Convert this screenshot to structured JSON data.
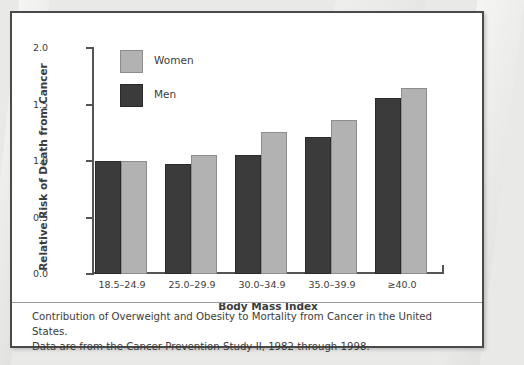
{
  "figure": {
    "caption_line1": "Contribution of Overweight and Obesity to Mortality from Cancer in the United States.",
    "caption_line2": "Data are from the Cancer Prevention Study II, 1982 through 1998."
  },
  "chart_data": {
    "type": "bar",
    "title": "",
    "xlabel": "Body Mass Index",
    "ylabel": "Relative Risk of Death from Cancer",
    "categories": [
      "18.5–24.9",
      "25.0–29.9",
      "30.0–34.9",
      "35.0–39.9",
      "≥40.0"
    ],
    "series": [
      {
        "name": "Men",
        "color": "#3b3b3b",
        "values": [
          1.0,
          0.97,
          1.05,
          1.21,
          1.56
        ]
      },
      {
        "name": "Women",
        "color": "#b2b2b2",
        "values": [
          1.0,
          1.05,
          1.26,
          1.36,
          1.65
        ]
      }
    ],
    "ylim": [
      0.0,
      2.0
    ],
    "yticks": [
      "0.0",
      "0.5",
      "1.0",
      "1.5",
      "2.0"
    ],
    "ytick_values": [
      0.0,
      0.5,
      1.0,
      1.5,
      2.0
    ],
    "grid": false,
    "legend_position": "top-left",
    "legend_order": [
      "Women",
      "Men"
    ]
  }
}
